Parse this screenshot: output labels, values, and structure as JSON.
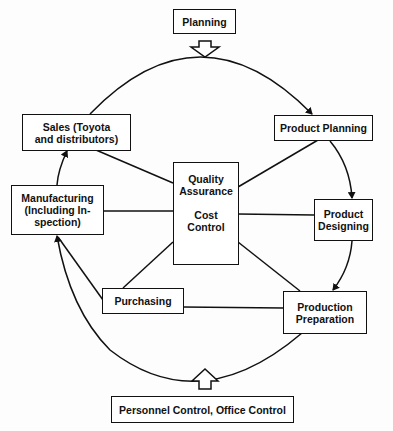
{
  "diagram": {
    "top_input": {
      "label": "Planning",
      "arrow": "hollow-arrow-down"
    },
    "bottom_input": {
      "label": "Personnel Control, Office Control",
      "arrow": "hollow-arrow-up"
    },
    "center": {
      "line1": "Quality\nAssurance",
      "line2": "Cost\nControl"
    },
    "cycle_nodes": [
      {
        "id": "product-planning",
        "label": "Product Planning"
      },
      {
        "id": "product-designing",
        "label": "Product\nDesigning"
      },
      {
        "id": "production-preparation",
        "label": "Production\nPreparation"
      },
      {
        "id": "purchasing",
        "label": "Purchasing"
      },
      {
        "id": "manufacturing",
        "label": "Manufacturing\n(Including In-\nspection)"
      },
      {
        "id": "sales",
        "label": "Sales (Toyota\nand distributors)"
      }
    ],
    "flow_direction": "clockwise",
    "line_color": "#111111",
    "background_color": "#fdfdfd"
  }
}
